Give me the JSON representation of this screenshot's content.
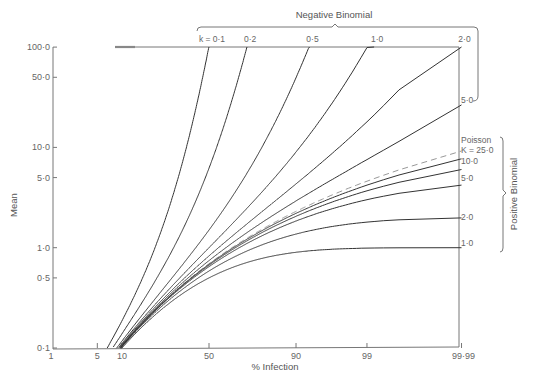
{
  "chart_data": {
    "type": "line",
    "title": "",
    "xlabel": "% Infection",
    "ylabel": "Mean",
    "x_scale": "probit",
    "y_scale": "log",
    "xlim": [
      1,
      99.99
    ],
    "ylim": [
      0.1,
      100.0
    ],
    "grid": false,
    "x_ticks": [
      {
        "value": 1,
        "label": "1"
      },
      {
        "value": 5,
        "label": "5"
      },
      {
        "value": 10,
        "label": "10"
      },
      {
        "value": 50,
        "label": "50"
      },
      {
        "value": 90,
        "label": "90"
      },
      {
        "value": 99,
        "label": "99"
      },
      {
        "value": 99.99,
        "label": "99·99"
      }
    ],
    "y_ticks": [
      {
        "value": 0.1,
        "label": "0·1"
      },
      {
        "value": 0.5,
        "label": "0·5"
      },
      {
        "value": 1.0,
        "label": "1·0"
      },
      {
        "value": 5.0,
        "label": "5·0"
      },
      {
        "value": 10.0,
        "label": "10·0"
      },
      {
        "value": 50.0,
        "label": "50·0"
      },
      {
        "value": 100.0,
        "label": "100·0"
      }
    ],
    "group_labels": {
      "negative_binomial": "Negative Binomial",
      "positive_binomial": "Positive Binomial"
    },
    "series": [
      {
        "name": "k = 0·1",
        "family": "negative_binomial",
        "param": 0.1,
        "label": "k = 0·1",
        "label_pos": "top",
        "dashed": false,
        "x": [
          10,
          20,
          30,
          40,
          50
        ],
        "values": [
          0.11,
          0.93,
          3.46,
          16.2,
          102
        ]
      },
      {
        "name": "k = 0·2",
        "family": "negative_binomial",
        "param": 0.2,
        "label": "0·2",
        "label_pos": "top",
        "dashed": false,
        "x": [
          10,
          30,
          50,
          70,
          80
        ],
        "values": [
          0.11,
          0.39,
          1.22,
          8.9,
          61.8
        ]
      },
      {
        "name": "k = 0·5",
        "family": "negative_binomial",
        "param": 0.5,
        "label": "0·5",
        "label_pos": "top",
        "dashed": false,
        "x": [
          10,
          30,
          50,
          80,
          90,
          99
        ],
        "values": [
          0.11,
          0.52,
          1.5,
          12,
          49.5,
          4999
        ]
      },
      {
        "name": "k = 1·0",
        "family": "negative_binomial",
        "param": 1.0,
        "label": "1·0",
        "label_pos": "top",
        "dashed": false,
        "x": [
          10,
          30,
          50,
          80,
          90,
          99
        ],
        "values": [
          0.11,
          0.43,
          1.0,
          4.0,
          9.0,
          99.0
        ]
      },
      {
        "name": "k = 2·0",
        "family": "negative_binomial",
        "param": 2.0,
        "label": "2·0",
        "label_pos": "top",
        "dashed": false,
        "x": [
          10,
          30,
          50,
          80,
          90,
          99,
          99.9
        ],
        "values": [
          0.11,
          0.39,
          0.83,
          2.47,
          4.32,
          18.0,
          61.2
        ]
      },
      {
        "name": "k = 5·0",
        "family": "negative_binomial",
        "param": 5.0,
        "label": "5·0",
        "label_pos": "right",
        "dashed": false,
        "x": [
          10,
          30,
          50,
          80,
          90,
          99,
          99.99
        ],
        "values": [
          0.11,
          0.37,
          0.74,
          1.9,
          2.92,
          7.56,
          26.5
        ]
      },
      {
        "name": "Poisson",
        "family": "poisson",
        "param": null,
        "label": "Poisson",
        "label_pos": "right",
        "dashed": true,
        "x": [
          10,
          30,
          50,
          80,
          90,
          99,
          99.99
        ],
        "values": [
          0.105,
          0.357,
          0.693,
          1.61,
          2.3,
          4.61,
          9.21
        ]
      },
      {
        "name": "K = 25·0",
        "family": "positive_binomial",
        "param": 25.0,
        "label": "K = 25·0",
        "label_pos": "right",
        "dashed": false,
        "x": [
          10,
          30,
          50,
          80,
          90,
          99,
          99.99
        ],
        "values": [
          0.105,
          0.354,
          0.683,
          1.56,
          2.2,
          4.2,
          7.73
        ]
      },
      {
        "name": "K = 10·0",
        "family": "positive_binomial",
        "param": 10.0,
        "label": "10·0",
        "label_pos": "right",
        "dashed": false,
        "x": [
          10,
          30,
          50,
          80,
          90,
          99,
          99.99
        ],
        "values": [
          0.104,
          0.351,
          0.67,
          1.49,
          2.06,
          3.69,
          6.02
        ]
      },
      {
        "name": "K = 5·0",
        "family": "positive_binomial",
        "param": 5.0,
        "label": "5·0",
        "label_pos": "right",
        "dashed": false,
        "x": [
          10,
          30,
          50,
          80,
          90,
          99,
          99.99
        ],
        "values": [
          0.104,
          0.345,
          0.647,
          1.38,
          1.85,
          3.01,
          4.21
        ]
      },
      {
        "name": "K = 2·0",
        "family": "positive_binomial",
        "param": 2.0,
        "label": "2·0",
        "label_pos": "right",
        "dashed": false,
        "x": [
          10,
          30,
          50,
          80,
          90,
          99,
          99.99
        ],
        "values": [
          0.103,
          0.327,
          0.586,
          1.11,
          1.37,
          1.8,
          1.98
        ]
      },
      {
        "name": "K = 1·0",
        "family": "positive_binomial",
        "param": 1.0,
        "label": "1·0",
        "label_pos": "right",
        "dashed": false,
        "x": [
          10,
          30,
          50,
          80,
          90,
          99,
          99.99
        ],
        "values": [
          0.1,
          0.3,
          0.5,
          0.8,
          0.9,
          0.99,
          0.9999
        ]
      }
    ]
  }
}
